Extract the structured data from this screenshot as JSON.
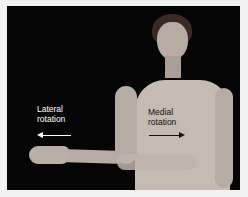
{
  "figure": {
    "labels": {
      "lateral_line1": "Lateral",
      "lateral_line2": "rotation",
      "medial_line1": "Medial",
      "medial_line2": "rotation"
    },
    "colors": {
      "background": "#050505",
      "border": "#f2f2f2",
      "skin": "#b9b0a8",
      "leotard": "#c8c0b8",
      "lateral_text": "#ffffff",
      "medial_text": "#111111"
    }
  }
}
